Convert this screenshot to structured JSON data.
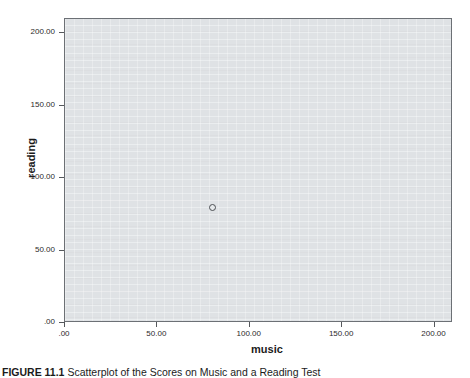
{
  "figure": {
    "caption_label": "FIGURE 11.1",
    "caption_text": "Scatterplot of the Scores on Music and a Reading Test",
    "caption_full": "FIGURE 11.1  Scatterplot of the Scores on Music and a Reading Test"
  },
  "chart_data": {
    "type": "scatter",
    "title": "",
    "xlabel": "music",
    "ylabel": "reading",
    "xlim": [
      0,
      210
    ],
    "ylim": [
      0,
      210
    ],
    "xticks": [
      0,
      50,
      100,
      150,
      200
    ],
    "yticks": [
      0,
      50,
      100,
      150,
      200
    ],
    "xticklabels": [
      ".00",
      "50.00",
      "100.00",
      "150.00",
      "200.00"
    ],
    "yticklabels": [
      ".00",
      "50.00",
      "100.00",
      "150.00",
      "200.00"
    ],
    "grid": false,
    "legend": false,
    "panel_color": "#dfe2e5",
    "marker_edge_color": "#4a4d52",
    "marker_style": "open-circle",
    "series": [
      {
        "name": "cases",
        "points": [
          {
            "x": 80,
            "y": 80
          }
        ]
      }
    ]
  }
}
